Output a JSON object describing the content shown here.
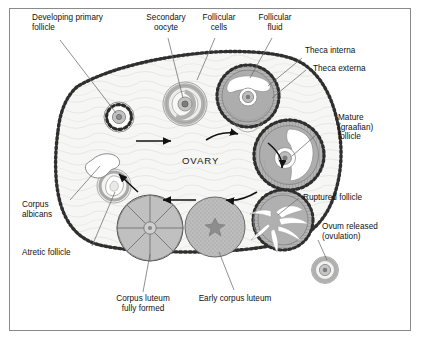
{
  "figure": {
    "center_label": "OVARY",
    "border_color": "#8a8a8a",
    "background_color": "#ffffff",
    "stroma_color": "#f4f4f2",
    "follicle_fill": "#b9b9b9",
    "fluid_color": "#ffffff",
    "epithelium_color": "#333333"
  },
  "labels": [
    {
      "id": "developing-primary-follicle",
      "text": "Developing primary\nfollicle"
    },
    {
      "id": "secondary-oocyte",
      "text": "Secondary\noocyte"
    },
    {
      "id": "follicular-cells",
      "text": "Follicular\ncells"
    },
    {
      "id": "follicular-fluid",
      "text": "Follicular\nfluid"
    },
    {
      "id": "theca-interna",
      "text": "Theca interna"
    },
    {
      "id": "theca-externa",
      "text": "Theca externa"
    },
    {
      "id": "mature-graafian-follicle",
      "text": "Mature\n(graafian)\nfollicle"
    },
    {
      "id": "ruptured-follicle",
      "text": "Ruptured follicle"
    },
    {
      "id": "ovum-released",
      "text": "Ovum released\n(ovulation)"
    },
    {
      "id": "corpus-albicans",
      "text": "Corpus\nalbicans"
    },
    {
      "id": "atretic-follicle",
      "text": "Atretic follicle"
    },
    {
      "id": "corpus-luteum-fully-formed",
      "text": "Corpus luteum\nfully formed"
    },
    {
      "id": "early-corpus-luteum",
      "text": "Early corpus luteum"
    }
  ],
  "structures": [
    {
      "id": "developing-primary-follicle",
      "stage": 1,
      "description": "Primordial/primary follicle, ring of granulosa cells around oocyte"
    },
    {
      "id": "secondary-oocyte",
      "stage": 2,
      "description": "Secondary follicle with concentric follicular cell layers"
    },
    {
      "id": "antral-follicle",
      "stage": 3,
      "description": "Antral follicle with follicular fluid cavity and theca layers"
    },
    {
      "id": "mature-graafian-follicle",
      "stage": 4,
      "description": "Mature graafian follicle, large antrum with oocyte"
    },
    {
      "id": "ruptured-follicle",
      "stage": 5,
      "description": "Ruptured follicle after ovulation"
    },
    {
      "id": "ovum-released",
      "stage": 6,
      "description": "Released ovum outside the ovary"
    },
    {
      "id": "early-corpus-luteum",
      "stage": 7,
      "description": "Early corpus luteum, stippled with central clot"
    },
    {
      "id": "corpus-luteum-fully-formed",
      "stage": 8,
      "description": "Corpus luteum fully formed, radially folded"
    },
    {
      "id": "atretic-follicle",
      "stage": 9,
      "description": "Atretic (degenerating) follicle"
    },
    {
      "id": "corpus-albicans",
      "stage": 10,
      "description": "Corpus albicans, white fibrous scar"
    }
  ],
  "flow_arrows": 6
}
